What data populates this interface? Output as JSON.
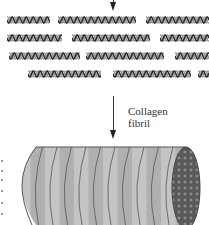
{
  "diagram": {
    "label": {
      "line1": "Collagen",
      "line2": "fibril"
    },
    "colors": {
      "helix_dark": "#2a2a2a",
      "helix_light": "#9a9a9a",
      "fibril_band_a": "#c4c4c4",
      "fibril_band_b": "#b0b0b0",
      "fibril_line": "#555555",
      "end_cap": "#6e6e6e"
    },
    "helix_rows": [
      {
        "y": 16,
        "segments": [
          [
            7,
            50
          ],
          [
            58,
            136
          ],
          [
            146,
            209
          ]
        ]
      },
      {
        "y": 34,
        "segments": [
          [
            7,
            62
          ],
          [
            72,
            150
          ],
          [
            160,
            209
          ]
        ]
      },
      {
        "y": 52,
        "segments": [
          [
            9,
            80
          ],
          [
            86,
            164
          ],
          [
            175,
            209
          ]
        ]
      },
      {
        "y": 70,
        "segments": [
          [
            28,
            101
          ],
          [
            113,
            191
          ],
          [
            198,
            209
          ]
        ]
      }
    ]
  }
}
